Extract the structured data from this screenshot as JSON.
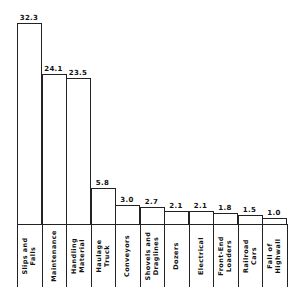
{
  "chart_data": {
    "type": "bar",
    "title": "",
    "xlabel": "",
    "ylabel": "",
    "ylim": [
      0,
      35
    ],
    "grid": false,
    "legend": null,
    "categories": [
      "Slips and Falls",
      "Maintenance",
      "Handling Material",
      "Haulage Truck",
      "Conveyors",
      "Shovels and Draglines",
      "Dozers",
      "Electrical",
      "Front-End Loaders",
      "Railroad Cars",
      "Fall of Highwall"
    ],
    "category_lines": [
      [
        "Slips  and",
        "Falls"
      ],
      [
        "Maintenance"
      ],
      [
        "Handling",
        "Material"
      ],
      [
        "Haulage",
        "Truck"
      ],
      [
        "Conveyors"
      ],
      [
        "Shovels and",
        "Draglines"
      ],
      [
        "Dozers"
      ],
      [
        "Electrical"
      ],
      [
        "Front-End",
        "Loaders"
      ],
      [
        "Railroad",
        "Cars"
      ],
      [
        "Fall  of",
        "Highwall"
      ]
    ],
    "values": [
      32.3,
      24.1,
      23.5,
      5.8,
      3.0,
      2.7,
      2.1,
      2.1,
      1.8,
      1.5,
      1.0
    ],
    "value_labels": [
      "32.3",
      "24.1",
      "23.5",
      "5.8",
      "3.0",
      "2.7",
      "2.1",
      "2.1",
      "1.8",
      "1.5",
      "1.0"
    ]
  }
}
